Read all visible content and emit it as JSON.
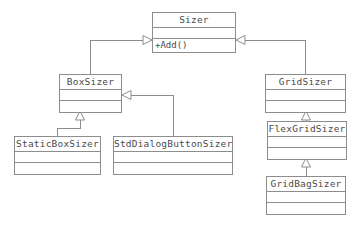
{
  "diagram": {
    "type": "uml-class-diagram",
    "background_color": "#ffffff",
    "line_color": "#8d8d8d",
    "text_color": "#4b4b4b",
    "classes": [
      {
        "id": "sizer",
        "name": "Sizer",
        "attributes": [],
        "operations": [
          "+Add()"
        ],
        "x": 152,
        "y": 12,
        "width": 84
      },
      {
        "id": "boxsizer",
        "name": "BoxSizer",
        "attributes": [],
        "operations": [],
        "x": 59,
        "y": 74,
        "width": 63
      },
      {
        "id": "gridsizer",
        "name": "GridSizer",
        "attributes": [],
        "operations": [],
        "x": 265,
        "y": 74,
        "width": 81
      },
      {
        "id": "staticboxsizer",
        "name": "StaticBoxSizer",
        "attributes": [],
        "operations": [],
        "x": 14,
        "y": 136,
        "width": 87
      },
      {
        "id": "stddialogbuttonsizer",
        "name": "StdDialogButtonSizer",
        "attributes": [],
        "operations": [],
        "x": 113,
        "y": 136,
        "width": 120
      },
      {
        "id": "flexgridsizer",
        "name": "FlexGridSizer",
        "attributes": [],
        "operations": [],
        "x": 267,
        "y": 121,
        "width": 80
      },
      {
        "id": "gridbagsizer",
        "name": "GridBagSizer",
        "attributes": [],
        "operations": [],
        "x": 266,
        "y": 176,
        "width": 80
      }
    ],
    "relationships": [
      {
        "id": "boxsizer-to-sizer",
        "type": "generalization",
        "from": "BoxSizer",
        "to": "Sizer"
      },
      {
        "id": "gridsizer-to-sizer",
        "type": "generalization",
        "from": "GridSizer",
        "to": "Sizer"
      },
      {
        "id": "staticboxsizer-to-boxsizer",
        "type": "generalization",
        "from": "StaticBoxSizer",
        "to": "BoxSizer"
      },
      {
        "id": "stddialogbuttonsizer-to-boxsizer",
        "type": "generalization",
        "from": "StdDialogButtonSizer",
        "to": "BoxSizer"
      },
      {
        "id": "flexgridsizer-to-gridsizer",
        "type": "generalization",
        "from": "FlexGridSizer",
        "to": "GridSizer"
      },
      {
        "id": "gridbagsizer-to-flexgridsizer",
        "type": "generalization",
        "from": "GridBagSizer",
        "to": "FlexGridSizer"
      }
    ]
  }
}
